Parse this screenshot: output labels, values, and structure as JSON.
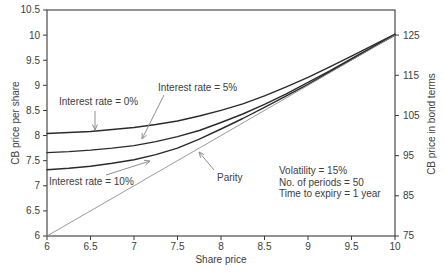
{
  "chart_data": {
    "type": "line",
    "title": "",
    "xlabel": "Share price",
    "ylabel_left": "CB price per share",
    "ylabel_right": "CB price in bond terms",
    "x_range": [
      6,
      10
    ],
    "y_left_range": [
      6,
      10.5
    ],
    "y_right_range": [
      75,
      125
    ],
    "grid": false,
    "legend_position": "none",
    "x_ticks": {
      "values": [
        6,
        6.5,
        7,
        7.5,
        8,
        8.5,
        9,
        9.5,
        10
      ],
      "labels": [
        "6",
        "6.5",
        "7",
        "7.5",
        "8",
        "8.5",
        "9",
        "9.5",
        "10"
      ]
    },
    "y_left_ticks": {
      "values": [
        6,
        6.5,
        7,
        7.5,
        8,
        8.5,
        9,
        9.5,
        10,
        10.5
      ],
      "labels": [
        "6",
        "6.5",
        "7",
        "7.5",
        "8",
        "8.5",
        "9",
        "9.5",
        "10",
        "10.5"
      ]
    },
    "y_right_ticks": {
      "values": [
        75,
        85,
        95,
        105,
        115,
        125
      ],
      "labels": [
        "75",
        "85",
        "95",
        "105",
        "115",
        "125"
      ]
    },
    "colors": {
      "background": "#ffffff",
      "axis": "#3a3a3a",
      "text": "#3d3d3d",
      "curve": "#2b2b2b",
      "parity": "#8f8f8f",
      "arrow": "#8f8f8f"
    },
    "series": [
      {
        "name": "Interest rate = 0%",
        "color": "#2b2b2b",
        "width": 1.4,
        "points": [
          [
            6,
            8.04
          ],
          [
            6.25,
            8.06
          ],
          [
            6.5,
            8.08
          ],
          [
            6.75,
            8.12
          ],
          [
            7,
            8.16
          ],
          [
            7.25,
            8.22
          ],
          [
            7.5,
            8.29
          ],
          [
            7.75,
            8.39
          ],
          [
            8,
            8.5
          ],
          [
            8.25,
            8.63
          ],
          [
            8.5,
            8.79
          ],
          [
            8.75,
            8.97
          ],
          [
            9,
            9.16
          ],
          [
            9.25,
            9.37
          ],
          [
            9.5,
            9.58
          ],
          [
            9.75,
            9.8
          ],
          [
            10,
            10.02
          ]
        ]
      },
      {
        "name": "Interest rate = 5%",
        "color": "#2b2b2b",
        "width": 1.4,
        "points": [
          [
            6,
            7.66
          ],
          [
            6.25,
            7.68
          ],
          [
            6.5,
            7.71
          ],
          [
            6.75,
            7.75
          ],
          [
            7,
            7.8
          ],
          [
            7.25,
            7.88
          ],
          [
            7.5,
            7.98
          ],
          [
            7.75,
            8.1
          ],
          [
            8,
            8.26
          ],
          [
            8.25,
            8.43
          ],
          [
            8.5,
            8.62
          ],
          [
            8.75,
            8.83
          ],
          [
            9,
            9.06
          ],
          [
            9.25,
            9.29
          ],
          [
            9.5,
            9.53
          ],
          [
            9.75,
            9.77
          ],
          [
            10,
            10.01
          ]
        ]
      },
      {
        "name": "Interest rate = 10%",
        "color": "#2b2b2b",
        "width": 1.4,
        "points": [
          [
            6,
            7.32
          ],
          [
            6.25,
            7.35
          ],
          [
            6.5,
            7.39
          ],
          [
            6.75,
            7.45
          ],
          [
            7,
            7.52
          ],
          [
            7.25,
            7.62
          ],
          [
            7.5,
            7.75
          ],
          [
            7.75,
            7.93
          ],
          [
            8,
            8.13
          ],
          [
            8.25,
            8.34
          ],
          [
            8.5,
            8.56
          ],
          [
            8.75,
            8.79
          ],
          [
            9,
            9.02
          ],
          [
            9.25,
            9.27
          ],
          [
            9.5,
            9.51
          ],
          [
            9.75,
            9.76
          ],
          [
            10,
            10.0
          ]
        ]
      },
      {
        "name": "Parity",
        "color": "#8f8f8f",
        "width": 0.9,
        "points": [
          [
            6,
            6
          ],
          [
            10,
            10
          ]
        ]
      }
    ],
    "annotations": {
      "interest0": {
        "label": "Interest rate = 0%",
        "pos": {
          "x": 59,
          "y": 96
        },
        "arrow": {
          "x1": 95,
          "y1": 111,
          "x2": 95,
          "y2": 130
        }
      },
      "interest5": {
        "label": "Interest rate = 5%",
        "pos": {
          "x": 158,
          "y": 82
        },
        "arrow": {
          "x1": 164,
          "y1": 95,
          "x2": 142,
          "y2": 139
        }
      },
      "interest10": {
        "label": "Interest rate = 10%",
        "pos": {
          "x": 49,
          "y": 176
        },
        "arrow": {
          "x1": 106,
          "y1": 175,
          "x2": 150,
          "y2": 161
        }
      },
      "parity": {
        "label": "Parity",
        "pos": {
          "x": 217,
          "y": 172
        },
        "arrow": {
          "x1": 214,
          "y1": 170,
          "x2": 199,
          "y2": 152
        }
      },
      "info": {
        "pos": {
          "x": 279,
          "y": 165
        },
        "lines": [
          "Volatility = 15%",
          "No. of periods = 50",
          "Time to expiry = 1 year"
        ]
      }
    },
    "xlabel_pos": {
      "x": 221,
      "y": 259
    },
    "ylabel_left_pos": {
      "x": 15,
      "y": 123
    },
    "ylabel_right_pos": {
      "x": 431,
      "y": 124
    }
  }
}
